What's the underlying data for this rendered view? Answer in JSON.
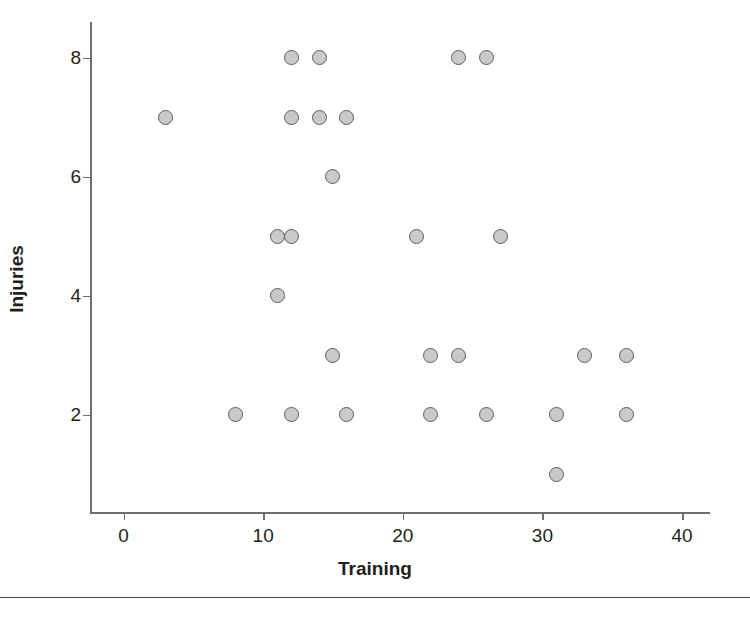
{
  "chart_data": {
    "type": "scatter",
    "title": "",
    "xlabel": "Training",
    "ylabel": "Injuries",
    "xlim": [
      -2.4,
      42
    ],
    "ylim": [
      0.35,
      8.6
    ],
    "grid": false,
    "legend": null,
    "xticks": [
      0,
      10,
      20,
      30,
      40
    ],
    "yticks": [
      2,
      4,
      6,
      8
    ],
    "xtick_labels": [
      "0",
      "10",
      "20",
      "30",
      "40"
    ],
    "ytick_labels": [
      "2",
      "4",
      "6",
      "8"
    ],
    "marker": {
      "shape": "circle",
      "fill_color": "#c9c9c9",
      "edge_color": "#5e5e5e",
      "size_px": 15
    },
    "axis_color": "#6f6f6f",
    "text_color": "#231f20",
    "background_color": "#ffffff",
    "n_points": 27,
    "points": [
      {
        "x": 3,
        "y": 7
      },
      {
        "x": 8,
        "y": 2
      },
      {
        "x": 11,
        "y": 5
      },
      {
        "x": 11,
        "y": 4
      },
      {
        "x": 12,
        "y": 8
      },
      {
        "x": 12,
        "y": 7
      },
      {
        "x": 12,
        "y": 5
      },
      {
        "x": 12,
        "y": 2
      },
      {
        "x": 14,
        "y": 8
      },
      {
        "x": 14,
        "y": 7
      },
      {
        "x": 15,
        "y": 6
      },
      {
        "x": 15,
        "y": 3
      },
      {
        "x": 16,
        "y": 7
      },
      {
        "x": 16,
        "y": 2
      },
      {
        "x": 21,
        "y": 5
      },
      {
        "x": 22,
        "y": 3
      },
      {
        "x": 22,
        "y": 2
      },
      {
        "x": 24,
        "y": 8
      },
      {
        "x": 24,
        "y": 3
      },
      {
        "x": 26,
        "y": 8
      },
      {
        "x": 26,
        "y": 2
      },
      {
        "x": 27,
        "y": 5
      },
      {
        "x": 31,
        "y": 2
      },
      {
        "x": 31,
        "y": 1
      },
      {
        "x": 33,
        "y": 3
      },
      {
        "x": 36,
        "y": 3
      },
      {
        "x": 36,
        "y": 2
      }
    ],
    "x_values": [
      3,
      8,
      11,
      11,
      12,
      12,
      12,
      12,
      14,
      14,
      15,
      15,
      16,
      16,
      21,
      22,
      22,
      24,
      24,
      26,
      26,
      27,
      31,
      31,
      33,
      36,
      36
    ],
    "y_values": [
      7,
      2,
      5,
      4,
      8,
      7,
      5,
      2,
      8,
      7,
      6,
      3,
      7,
      2,
      5,
      3,
      2,
      8,
      3,
      8,
      2,
      5,
      2,
      1,
      3,
      3,
      2
    ]
  }
}
